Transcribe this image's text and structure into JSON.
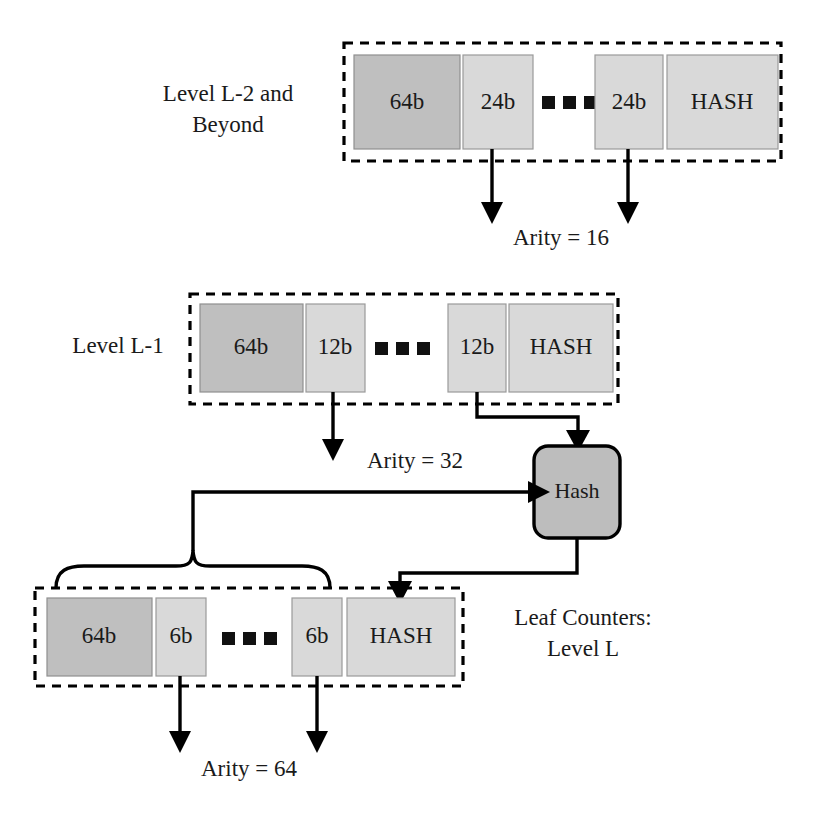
{
  "figure": {
    "colors": {
      "counter_fill": "#bfbfbf",
      "delta_fill": "#d9d9d9",
      "hash_field_fill": "#d9d9d9",
      "hash_node_fill": "#bdbdbd",
      "border": "#000000",
      "text": "#1a1a1a",
      "background": "#ffffff"
    }
  },
  "levels": [
    {
      "id": "level-upper",
      "side_label_lines": [
        "Level L-2 and",
        "Beyond"
      ],
      "cells": [
        {
          "label": "64b",
          "kind": "counter"
        },
        {
          "label": "24b",
          "kind": "delta"
        },
        {
          "label": "ellipsis",
          "kind": "ellipsis"
        },
        {
          "label": "24b",
          "kind": "delta"
        },
        {
          "label": "HASH",
          "kind": "hash"
        }
      ],
      "arity_label": "Arity = 16"
    },
    {
      "id": "level-l-minus-1",
      "side_label_lines": [
        "Level L-1"
      ],
      "cells": [
        {
          "label": "64b",
          "kind": "counter"
        },
        {
          "label": "12b",
          "kind": "delta"
        },
        {
          "label": "ellipsis",
          "kind": "ellipsis"
        },
        {
          "label": "12b",
          "kind": "delta"
        },
        {
          "label": "HASH",
          "kind": "hash"
        }
      ],
      "arity_label": "Arity = 32"
    },
    {
      "id": "level-leaf",
      "side_label_lines": [
        "Leaf Counters:",
        "Level L"
      ],
      "cells": [
        {
          "label": "64b",
          "kind": "counter"
        },
        {
          "label": "6b",
          "kind": "delta"
        },
        {
          "label": "ellipsis",
          "kind": "ellipsis"
        },
        {
          "label": "6b",
          "kind": "delta"
        },
        {
          "label": "HASH",
          "kind": "hash"
        }
      ],
      "arity_label": "Arity = 64"
    }
  ],
  "hash_node": {
    "label": "Hash"
  }
}
